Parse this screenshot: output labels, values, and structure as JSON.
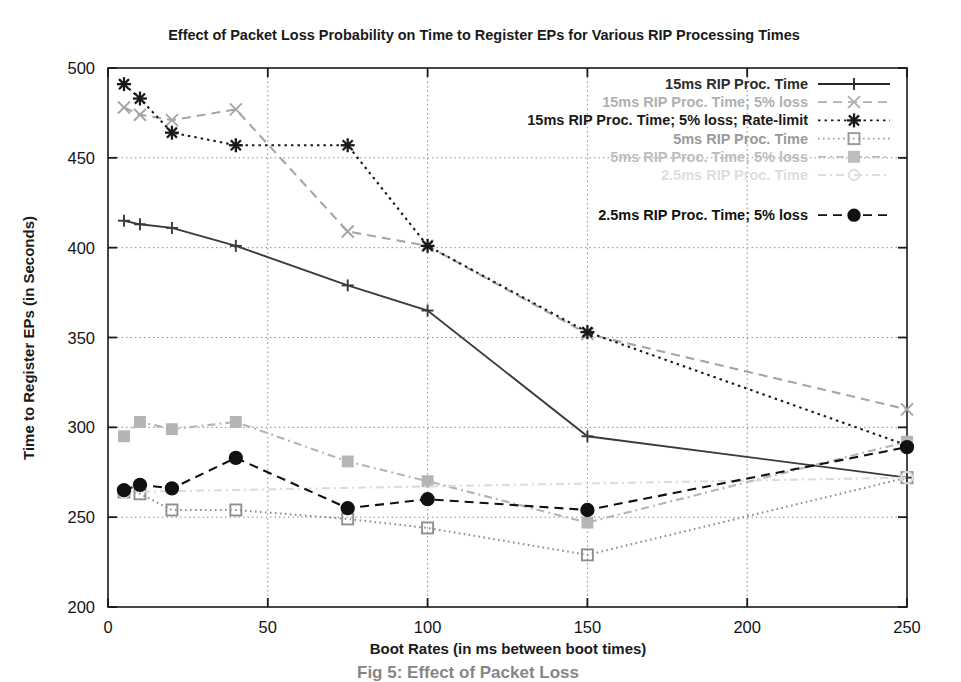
{
  "figure": {
    "title": "Effect of Packet Loss Probability on Time to Register EPs for Various RIP Processing Times",
    "caption": "Fig 5: Effect of Packet Loss"
  },
  "chart_data": {
    "type": "line",
    "title": "Effect of Packet Loss Probability on Time to Register EPs for Various RIP Processing Times",
    "xlabel": "Boot Rates (in ms between boot times)",
    "ylabel": "Time to Register EPs (in Seconds)",
    "xlim": [
      0,
      250
    ],
    "ylim": [
      200,
      500
    ],
    "xticks": [
      0,
      50,
      100,
      150,
      200,
      250
    ],
    "yticks": [
      200,
      250,
      300,
      350,
      400,
      450,
      500
    ],
    "grid": true,
    "legend_position": "top-right inside",
    "series": [
      {
        "name": "15ms RIP Proc. Time",
        "marker": "plus",
        "dash": "solid",
        "color": "#3a3a3a",
        "x": [
          5,
          10,
          20,
          40,
          75,
          100,
          150,
          250
        ],
        "y": [
          415,
          413,
          411,
          401,
          379,
          365,
          295,
          272
        ]
      },
      {
        "name": "15ms RIP Proc. Time; 5% loss",
        "marker": "cross",
        "dash": "dashed",
        "color": "#a6a6a6",
        "x": [
          5,
          10,
          20,
          40,
          75,
          100,
          150,
          250
        ],
        "y": [
          478,
          474,
          471,
          477,
          409,
          401,
          352,
          310
        ]
      },
      {
        "name": "15ms RIP Proc. Time; 5% loss; Rate-limit",
        "marker": "star",
        "dash": "dotted",
        "color": "#1a1a1a",
        "x": [
          5,
          10,
          20,
          40,
          75,
          100,
          150,
          250
        ],
        "y": [
          491,
          483,
          464,
          457,
          457,
          401,
          353,
          290
        ]
      },
      {
        "name": "5ms RIP Proc. Time",
        "marker": "open-square",
        "dash": "fine-dotted",
        "color": "#8f8f8f",
        "x": [
          5,
          10,
          20,
          40,
          75,
          100,
          150,
          250
        ],
        "y": [
          264,
          263,
          254,
          254,
          249,
          244,
          229,
          272
        ]
      },
      {
        "name": "5ms RIP Proc. Time; 5% loss",
        "marker": "filled-square",
        "dash": "dashdot",
        "color": "#b5b5b5",
        "x": [
          5,
          10,
          20,
          40,
          75,
          100,
          150,
          250
        ],
        "y": [
          295,
          303,
          299,
          303,
          281,
          270,
          247,
          292
        ]
      },
      {
        "name": "2.5ms RIP Proc. Time",
        "marker": "open-circle",
        "dash": "dashdot",
        "color": "#dcdcdc",
        "x": [
          5,
          250
        ],
        "y": [
          264,
          272
        ]
      },
      {
        "name": "2.5ms RIP Proc. Time; 5% loss",
        "marker": "filled-circle",
        "dash": "dashed",
        "color": "#111111",
        "x": [
          5,
          10,
          20,
          40,
          75,
          100,
          150,
          250
        ],
        "y": [
          265,
          268,
          266,
          283,
          255,
          260,
          254,
          289
        ]
      }
    ]
  },
  "legend": {
    "items": [
      {
        "label": "15ms RIP Proc. Time",
        "marker": "plus-icon"
      },
      {
        "label": "15ms RIP Proc. Time; 5% loss",
        "marker": "cross-icon"
      },
      {
        "label": "15ms RIP Proc. Time; 5% loss; Rate-limit",
        "marker": "star-icon"
      },
      {
        "label": "5ms RIP Proc. Time",
        "marker": "open-square-icon"
      },
      {
        "label": "5ms RIP Proc. Time; 5% loss",
        "marker": "filled-square-icon"
      },
      {
        "label": "2.5ms RIP Proc. Time",
        "marker": "open-circle-icon"
      },
      {
        "label": "2.5ms RIP Proc. Time; 5% loss",
        "marker": "filled-circle-icon"
      }
    ]
  },
  "colors": {
    "axis": "#1a1a1a",
    "grid": "#909090",
    "background": "#ffffff"
  }
}
